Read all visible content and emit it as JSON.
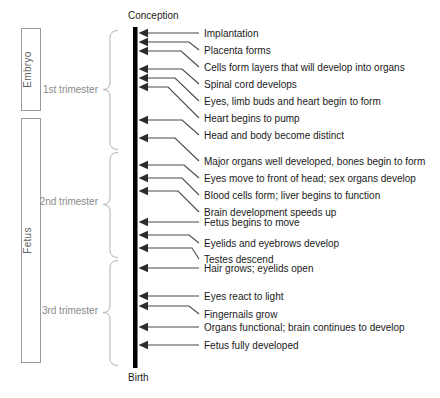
{
  "diagram": {
    "axis": {
      "top_label": "Conception",
      "bottom_label": "Birth",
      "color": "#000000"
    },
    "stages": [
      {
        "name": "Embryo",
        "label": "Embryo"
      },
      {
        "name": "Fetus",
        "label": "Fetus"
      }
    ],
    "trimesters": [
      {
        "label": "1st trimester"
      },
      {
        "label": "2nd trimester"
      },
      {
        "label": "3rd trimester"
      }
    ],
    "events": [
      {
        "label": "Implantation",
        "trimester": "1st trimester"
      },
      {
        "label": "Placenta forms",
        "trimester": "1st trimester"
      },
      {
        "label": "Cells form layers that will develop into organs",
        "trimester": "1st trimester"
      },
      {
        "label": "Spinal cord develops",
        "trimester": "1st trimester"
      },
      {
        "label": "Eyes, limb buds and heart begin to form",
        "trimester": "1st trimester"
      },
      {
        "label": "Heart begins to pump",
        "trimester": "1st trimester"
      },
      {
        "label": "Head and body become distinct",
        "trimester": "1st trimester"
      },
      {
        "label": "Major organs well developed, bones begin to form",
        "trimester": "2nd trimester"
      },
      {
        "label": "Eyes move to front of head; sex organs develop",
        "trimester": "2nd trimester"
      },
      {
        "label": "Blood cells form; liver begins to function",
        "trimester": "2nd trimester"
      },
      {
        "label": "Brain development speeds up",
        "trimester": "2nd trimester"
      },
      {
        "label": "Fetus begins to move",
        "trimester": "2nd trimester"
      },
      {
        "label": "Eyelids and eyebrows develop",
        "trimester": "2nd trimester"
      },
      {
        "label": "Testes descend",
        "trimester": "2nd trimester"
      },
      {
        "label": "Hair grows; eyelids open",
        "trimester": "3rd trimester"
      },
      {
        "label": "Eyes react to light",
        "trimester": "3rd trimester"
      },
      {
        "label": "Fingernails grow",
        "trimester": "3rd trimester"
      },
      {
        "label": "Organs functional; brain continues to develop",
        "trimester": "3rd trimester"
      },
      {
        "label": "Fetus fully developed",
        "trimester": "3rd trimester"
      }
    ]
  }
}
